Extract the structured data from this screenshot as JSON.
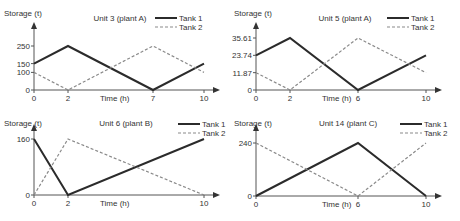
{
  "chart_data": [
    {
      "type": "line",
      "title": "Unit 3 (plant A)",
      "xlabel": "Time (h)",
      "ylabel": "Storage (t)",
      "x_ticks": [
        "0",
        "2",
        "7",
        "10"
      ],
      "y_ticks": [
        "0",
        "100",
        "150",
        "250"
      ],
      "xlim": [
        0,
        10
      ],
      "ylim": [
        0,
        250
      ],
      "legend": [
        "Tank 1",
        "Tank 2"
      ],
      "series": [
        {
          "name": "Tank 1",
          "style": "solid",
          "x": [
            0,
            2,
            7,
            10
          ],
          "values": [
            150,
            250,
            0,
            150
          ]
        },
        {
          "name": "Tank 2",
          "style": "dashed",
          "x": [
            0,
            2,
            7,
            10
          ],
          "values": [
            100,
            0,
            250,
            100
          ]
        }
      ]
    },
    {
      "type": "line",
      "title": "Unit 5 (plant A)",
      "xlabel": "Time (h)",
      "ylabel": "Storage (t)",
      "x_ticks": [
        "0",
        "2",
        "6",
        "10"
      ],
      "y_ticks": [
        "0",
        "11.87",
        "23.74",
        "35.61"
      ],
      "xlim": [
        0,
        10
      ],
      "ylim": [
        0,
        35.61
      ],
      "legend": [
        "Tank 1",
        "Tank 2"
      ],
      "series": [
        {
          "name": "Tank 1",
          "style": "solid",
          "x": [
            0,
            2,
            6,
            10
          ],
          "values": [
            23.74,
            35.61,
            0,
            23.74
          ]
        },
        {
          "name": "Tank 2",
          "style": "dashed",
          "x": [
            0,
            2,
            6,
            10
          ],
          "values": [
            11.87,
            0,
            35.61,
            11.87
          ]
        }
      ]
    },
    {
      "type": "line",
      "title": "Unit 6 (plant B)",
      "xlabel": "Time (h)",
      "ylabel": "Storage (t)",
      "x_ticks": [
        "0",
        "2",
        "10"
      ],
      "y_ticks": [
        "0",
        "160"
      ],
      "xlim": [
        0,
        10
      ],
      "ylim": [
        0,
        160
      ],
      "legend": [
        "Tank 1",
        "Tank 2"
      ],
      "series": [
        {
          "name": "Tank 1",
          "style": "solid",
          "x": [
            0,
            2,
            10
          ],
          "values": [
            160,
            0,
            160
          ]
        },
        {
          "name": "Tank 2",
          "style": "dashed",
          "x": [
            0,
            2,
            10
          ],
          "values": [
            0,
            160,
            0
          ]
        }
      ]
    },
    {
      "type": "line",
      "title": "Unit 14 (plant C)",
      "xlabel": "Time (h)",
      "ylabel": "Storage (t)",
      "x_ticks": [
        "0",
        "6",
        "10"
      ],
      "y_ticks": [
        "0",
        "240"
      ],
      "xlim": [
        0,
        10
      ],
      "ylim": [
        0,
        240
      ],
      "legend": [
        "Tank 1",
        "Tank 2"
      ],
      "series": [
        {
          "name": "Tank 1",
          "style": "solid",
          "x": [
            0,
            6,
            10
          ],
          "values": [
            0,
            240,
            0
          ]
        },
        {
          "name": "Tank 2",
          "style": "dashed",
          "x": [
            0,
            6,
            10
          ],
          "values": [
            240,
            0,
            240
          ]
        }
      ]
    }
  ],
  "colors": {
    "tank1": "#2b2b2b",
    "tank2": "#8a8a8a",
    "axis": "#555555"
  }
}
